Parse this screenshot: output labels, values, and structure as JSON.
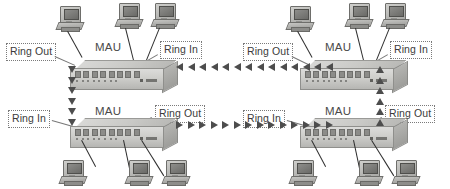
{
  "diagram": {
    "colors": {
      "arrow": "#4d4d4d",
      "chassis_light": "#dcdcda",
      "chassis_dark": "#b6b6b3",
      "label_text": "#3b3b3b",
      "label_border": "#7a7a7a",
      "wire": "#2e2e2e",
      "background": "#ffffff"
    },
    "labels": {
      "mau": "MAU",
      "ring_in": "Ring In",
      "ring_out": "Ring Out"
    },
    "units": [
      {
        "id": "mau-top-left",
        "device_label": "MAU",
        "left_port_label": "Ring Out",
        "right_port_label": "Ring In",
        "workstation_count": 3,
        "workstations_position": "above"
      },
      {
        "id": "mau-top-right",
        "device_label": "MAU",
        "left_port_label": "Ring Out",
        "right_port_label": "Ring In",
        "workstation_count": 3,
        "workstations_position": "above"
      },
      {
        "id": "mau-bottom-left",
        "device_label": "MAU",
        "left_port_label": "Ring In",
        "right_port_label": "Ring Out",
        "workstation_count": 3,
        "workstations_position": "below"
      },
      {
        "id": "mau-bottom-right",
        "device_label": "MAU",
        "left_port_label": "Ring In",
        "right_port_label": "Ring Out",
        "workstation_count": 3,
        "workstations_position": "below"
      }
    ],
    "ring_paths": [
      {
        "id": "top-trunk",
        "direction": "left",
        "arrow_count": 14
      },
      {
        "id": "bottom-trunk",
        "direction": "right",
        "arrow_count": 14
      },
      {
        "id": "left-riser",
        "direction": "down",
        "arrow_count": 6
      },
      {
        "id": "right-riser",
        "direction": "up",
        "arrow_count": 6
      }
    ]
  }
}
